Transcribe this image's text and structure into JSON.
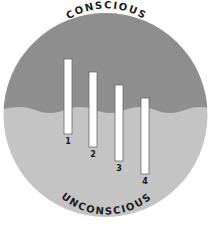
{
  "diagram": {
    "top_label": "CONSCIOUS",
    "bottom_label": "UNCONSCIOUS",
    "colors": {
      "conscious_region": "#8e8e8e",
      "unconscious_region": "#c4c4c4",
      "bar_fill": "#ffffff",
      "bar_outline": "#6a6a6a",
      "text": "#1a1a1a"
    },
    "bars": [
      {
        "label": "1",
        "x": 64,
        "top": 59,
        "bottom": 134
      },
      {
        "label": "2",
        "x": 89,
        "top": 72,
        "bottom": 147
      },
      {
        "label": "3",
        "x": 114,
        "top": 85,
        "bottom": 161
      },
      {
        "label": "4",
        "x": 141,
        "top": 98,
        "bottom": 174
      }
    ]
  }
}
